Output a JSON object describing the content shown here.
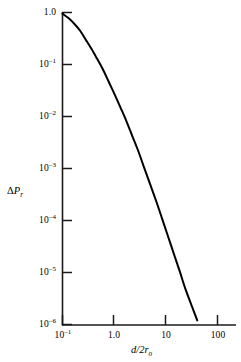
{
  "chart_data": {
    "type": "line",
    "title": "",
    "subtitle": "",
    "xlabel": "d/2r_o",
    "ylabel": "ΔP_r",
    "xscale": "log",
    "yscale": "log",
    "xlim": [
      0.1,
      250
    ],
    "ylim": [
      1e-06,
      1.0
    ],
    "grid": false,
    "legend": null,
    "xtick_labels": [
      "10⁻¹",
      "1.0",
      "10",
      "100"
    ],
    "xtick_values": [
      0.1,
      1.0,
      10,
      100
    ],
    "ytick_labels": [
      "1.0",
      "10⁻¹",
      "10⁻²",
      "10⁻³",
      "10⁻⁴",
      "10⁻⁵",
      "10⁻⁶"
    ],
    "ytick_values": [
      1.0,
      0.1,
      0.01,
      0.001,
      0.0001,
      1e-05,
      1e-06
    ],
    "series": [
      {
        "name": "ΔP_r",
        "color": "#000000",
        "linewidth": 2.0,
        "x": [
          0.1,
          0.13,
          0.17,
          0.22,
          0.28,
          0.36,
          0.46,
          0.6,
          0.77,
          1.0,
          1.3,
          1.7,
          2.2,
          2.9,
          3.7,
          4.8,
          6.3,
          8.2,
          10.6,
          13.8,
          18,
          23,
          30,
          39,
          51,
          66,
          86,
          112,
          145,
          190
        ],
        "y": [
          0.95,
          0.78,
          0.6,
          0.44,
          0.3,
          0.2,
          0.13,
          0.08,
          0.047,
          0.027,
          0.015,
          0.0081,
          0.0042,
          0.0021,
          0.00105,
          0.00051,
          0.00024,
          0.00011,
          5.1e-05,
          2.31e-05,
          1.05e-05,
          4.9e-06,
          2.4e-06,
          1.2e-06,
          7e-07,
          5.5e-07,
          4.8e-07,
          4.4e-07,
          4.2e-07,
          4e-07
        ]
      }
    ]
  },
  "labels": {
    "y_axis_title_delta": "Δ",
    "y_axis_title_p": "P",
    "y_axis_title_sub": "r",
    "x_axis_title_num": "d",
    "x_axis_title_den": "/2r",
    "x_axis_title_sub": "o",
    "ytick_0": "1.0",
    "ytick_1_base": "10",
    "ytick_1_exp": "–1",
    "ytick_2_base": "10",
    "ytick_2_exp": "–2",
    "ytick_3_base": "10",
    "ytick_3_exp": "–3",
    "ytick_4_base": "10",
    "ytick_4_exp": "–4",
    "ytick_5_base": "10",
    "ytick_5_exp": "–5",
    "ytick_6_base": "10",
    "ytick_6_exp": "–6",
    "xtick_0_base": "10",
    "xtick_0_exp": "–1",
    "xtick_1": "1.0",
    "xtick_2": "10",
    "xtick_3": "100"
  },
  "style": {
    "axis_color": "#1a1a1a",
    "curve_color": "#000000",
    "background": "#ffffff"
  }
}
